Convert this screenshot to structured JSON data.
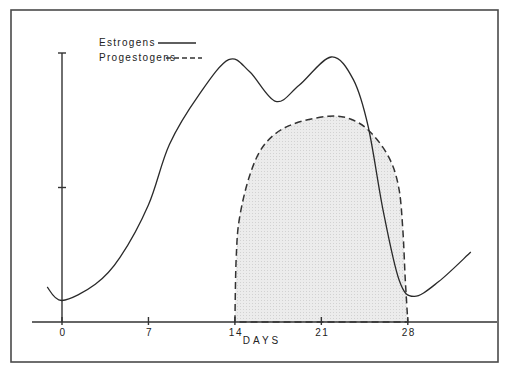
{
  "chart_data": {
    "type": "line",
    "title": "",
    "xlabel": "DAYS",
    "ylabel": "",
    "x_ticks": [
      0,
      7,
      14,
      21,
      28
    ],
    "x_tick_labels": [
      "0",
      "7",
      "14",
      "21",
      "28"
    ],
    "y_ticks": [
      1,
      2
    ],
    "xlim": [
      -1.5,
      35
    ],
    "ylim": [
      0,
      2
    ],
    "grid": false,
    "legend": {
      "placement": "top-left",
      "entries": [
        {
          "label": "Estrogens",
          "style": "solid"
        },
        {
          "label": "Progestogens",
          "style": "dashed"
        }
      ]
    },
    "series": [
      {
        "name": "Estrogens",
        "style": "solid",
        "x": [
          -1.2,
          0,
          2.7,
          4.7,
          7,
          8.7,
          11.1,
          13.5,
          15.2,
          17.3,
          19.2,
          21.8,
          23.6,
          24.8,
          26,
          27.3,
          28.5,
          30.5,
          33.1
        ],
        "y": [
          0.26,
          0.16,
          0.28,
          0.48,
          0.87,
          1.32,
          1.69,
          1.95,
          1.86,
          1.64,
          1.76,
          1.97,
          1.8,
          1.45,
          0.83,
          0.31,
          0.19,
          0.3,
          0.52
        ]
      },
      {
        "name": "Progestogens",
        "style": "dashed",
        "filled": true,
        "x": [
          14,
          14.1,
          14.35,
          15.2,
          16.4,
          18.4,
          21.6,
          23.6,
          25.2,
          26.6,
          27.3,
          27.6,
          27.8,
          28
        ],
        "y": [
          0,
          0.46,
          0.76,
          1.09,
          1.32,
          1.46,
          1.53,
          1.5,
          1.39,
          1.2,
          0.98,
          0.68,
          0.31,
          0
        ]
      }
    ]
  }
}
